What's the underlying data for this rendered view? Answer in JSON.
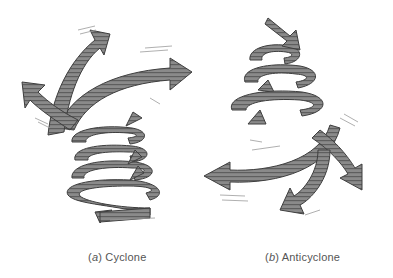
{
  "figure": {
    "panels": [
      {
        "id": "a",
        "letter": "a",
        "title": "Cyclone",
        "description": "Air spirals inward and upward; arrows converge at bottom and spread outward at top"
      },
      {
        "id": "b",
        "letter": "b",
        "title": "Anticyclone",
        "description": "Air spirals downward and outward; narrow coil at top, arrows spread outward at bottom"
      }
    ],
    "colors": {
      "ribbon_fill": "#8a8a8a",
      "ribbon_dark": "#4a4a4a",
      "ribbon_stripe": "#5e5e5e",
      "motion_lines": "#9a9a9a",
      "background": "#ffffff",
      "caption": "#555555"
    }
  }
}
